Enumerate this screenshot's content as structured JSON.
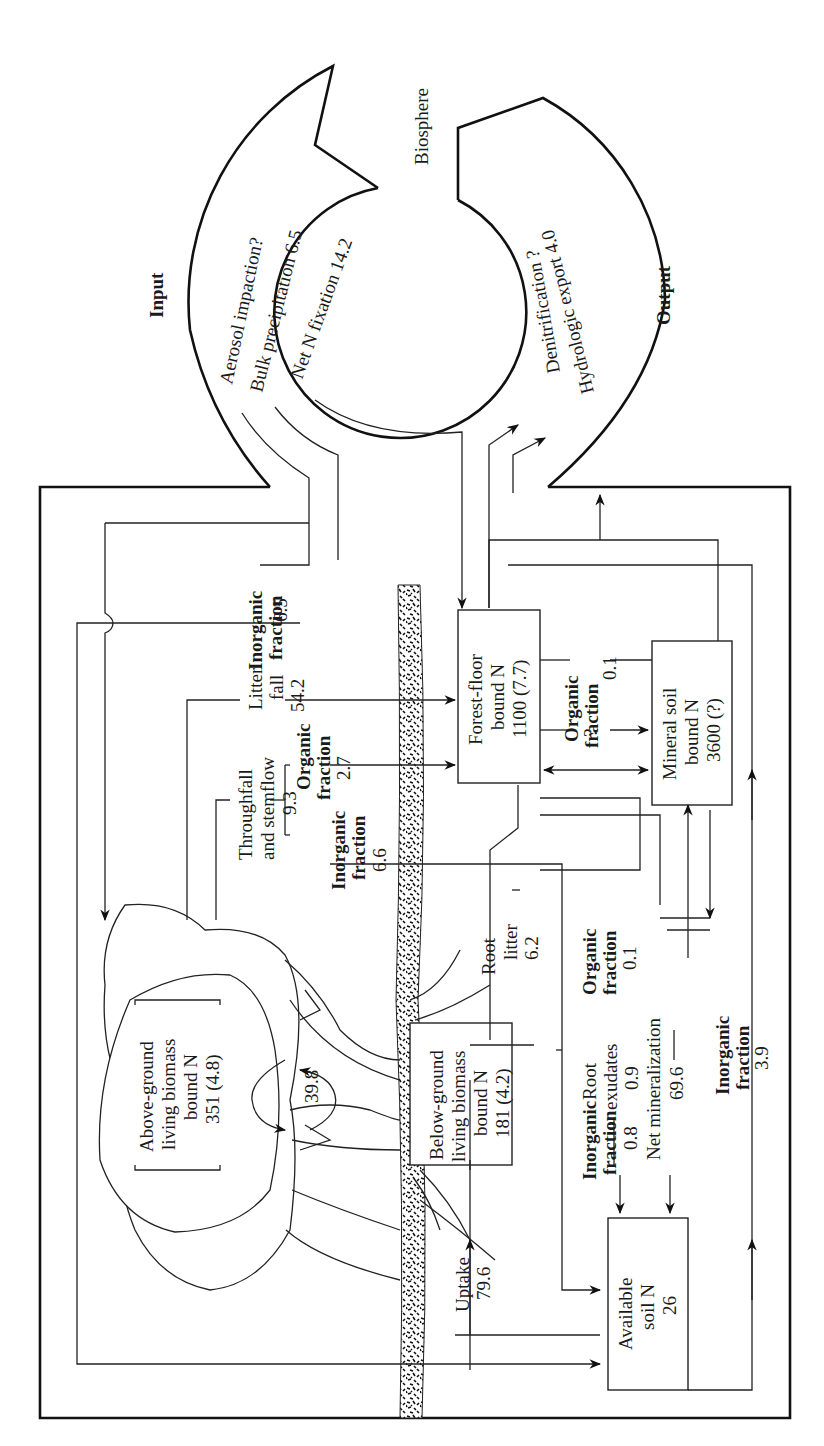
{
  "diagram": {
    "orientation": "rotated 90° counter-clockwise",
    "biosphere": {
      "label": "Biosphere",
      "input": {
        "heading": "Input",
        "lines": [
          "Aerosol impaction?",
          "Bulk precipitation 6.5",
          "Net N fixation 14.2"
        ]
      },
      "output": {
        "heading": "Output",
        "lines": [
          "Denitrification ?",
          "Hydrologic export 4.0"
        ]
      }
    },
    "pools": {
      "above_ground": [
        "Above-ground",
        "living biomass",
        "bound N",
        "351 (4.8)"
      ],
      "below_ground": [
        "Below-ground",
        "living biomass",
        "bound N",
        "181 (4.2)"
      ],
      "forest_floor": [
        "Forest-floor",
        "bound N",
        "1100 (7.7)"
      ],
      "mineral_soil": [
        "Mineral soil",
        "bound N",
        "3600 (?)"
      ],
      "available_soil": [
        "Available",
        "soil N",
        "26"
      ]
    },
    "flows": {
      "inorganic_65": {
        "label": [
          "Inorganic",
          "fraction"
        ],
        "value": "6.5"
      },
      "litter_fall": [
        "Litter",
        "fall",
        "54.2"
      ],
      "throughfall": [
        "Throughfall",
        "and stemflow",
        "9.3"
      ],
      "organic_27": {
        "label": [
          "Organic",
          "fraction"
        ],
        "value": "2.7"
      },
      "inorganic_66": {
        "label": [
          "Inorganic",
          "fraction"
        ],
        "value": "6.6"
      },
      "internal_39": "39.8",
      "organic_01_top": {
        "label": [
          "Organic",
          "fraction"
        ],
        "value": "0.1"
      },
      "question": "?",
      "root_litter": [
        "Root",
        "litter",
        "6.2"
      ],
      "organic_01_bottom": {
        "label": [
          "Organic",
          "fraction"
        ],
        "value": "0.1"
      },
      "root_exudates": [
        "Root",
        "exudates",
        "0.9"
      ],
      "inorganic_08": {
        "label": [
          "Inorganic",
          "fraction"
        ],
        "value": "0.8"
      },
      "net_mineralization": [
        "Net mineralization",
        "69.6"
      ],
      "inorganic_39": {
        "label": [
          "Inorganic",
          "fraction"
        ],
        "value": "3.9"
      },
      "uptake": [
        "Uptake",
        "79.6"
      ]
    }
  }
}
